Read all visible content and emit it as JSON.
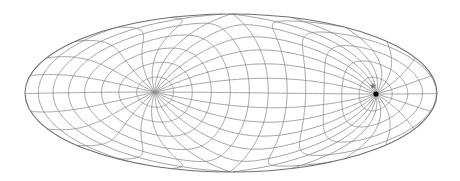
{
  "map": {
    "title": "Oblique Hammer projection graticule",
    "projection": "hammer",
    "ellipse": {
      "cx": 231,
      "cy": 93,
      "rx": 206,
      "ry": 79
    },
    "graticule_step_deg": 15,
    "pole_marker": {
      "x": 376,
      "y": 94,
      "color": "#000000"
    },
    "star_marker": {
      "x": 373,
      "y": 86,
      "color": "#777777"
    },
    "line_color": "#8a8a8a",
    "outline_color": "#6e6e6e",
    "background": "#ffffff"
  }
}
